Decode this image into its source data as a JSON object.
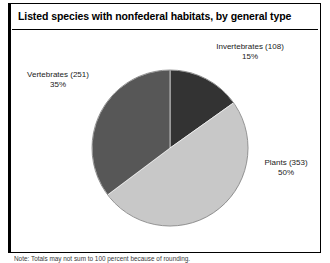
{
  "figure": {
    "title": "Listed species with nonfederal habitats, by general type",
    "note": "Note: Totals may not sum to 100 percent because of rounding."
  },
  "chart_data": {
    "type": "pie",
    "title": "Listed species with nonfederal habitats, by general type",
    "xlabel": "",
    "ylabel": "",
    "legend_position": "outside-labels",
    "grid": false,
    "total": 712,
    "categories": [
      "Invertebrates",
      "Plants",
      "Vertebrates"
    ],
    "values": [
      108,
      353,
      251
    ],
    "percentages": [
      15,
      50,
      35
    ],
    "colors": [
      "#333333",
      "#c8c8c8",
      "#575757"
    ],
    "start_angle_deg": 0,
    "direction": "clockwise",
    "slices": [
      {
        "name": "Invertebrates",
        "count": 108,
        "percent": 15,
        "color": "#333333",
        "label_name": "Invertebrates (108)",
        "label_pct": "15%"
      },
      {
        "name": "Plants",
        "count": 353,
        "percent": 50,
        "color": "#c8c8c8",
        "label_name": "Plants (353)",
        "label_pct": "50%"
      },
      {
        "name": "Vertebrates",
        "count": 251,
        "percent": 35,
        "color": "#575757",
        "label_name": "Vertebrates (251)",
        "label_pct": "35%"
      }
    ]
  }
}
